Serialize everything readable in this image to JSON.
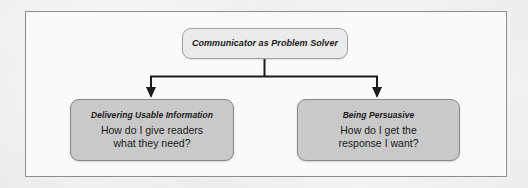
{
  "figure": {
    "type": "hierarchy-diagram",
    "background_color": "#f6f6f4",
    "frame_border_color": "#8d8f8f",
    "connector_color": "#1c1c1c"
  },
  "root": {
    "title": "Communicator as Problem Solver",
    "fill_color": "#ebebeb"
  },
  "branches": [
    {
      "title": "Delivering Usable Information",
      "question": "How do I give readers\nwhat they need?",
      "fill_color": "#c9c9c9"
    },
    {
      "title": "Being Persuasive",
      "question": "How do I get the\nresponse I want?",
      "fill_color": "#c9c9c9"
    }
  ]
}
